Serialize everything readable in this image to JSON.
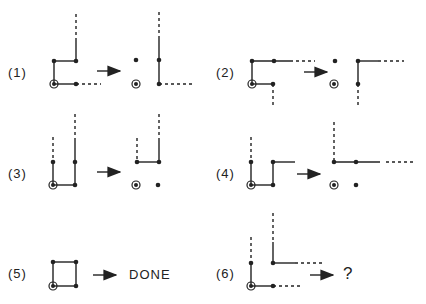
{
  "figure": {
    "panels": [
      {
        "label": "(1)",
        "result": ""
      },
      {
        "label": "(2)",
        "result": ""
      },
      {
        "label": "(3)",
        "result": ""
      },
      {
        "label": "(4)",
        "result": ""
      },
      {
        "label": "(5)",
        "result": "DONE"
      },
      {
        "label": "(6)",
        "result": "?"
      }
    ],
    "legend": {
      "solid_line": "edge",
      "dashed_line": "continuation",
      "filled_dot": "node",
      "ringed_dot": "origin node"
    },
    "colors": {
      "ink": "#222222",
      "background": "#ffffff"
    }
  }
}
